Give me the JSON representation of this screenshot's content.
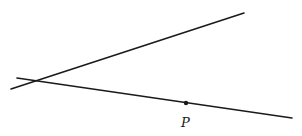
{
  "diagram": {
    "type": "geometry",
    "colors": {
      "stroke": "#1a1a1a",
      "background": "#ffffff"
    },
    "lines": [
      {
        "name": "upper-line",
        "x1": 11,
        "y1": 89,
        "x2": 244,
        "y2": 13
      },
      {
        "name": "lower-line",
        "x1": 17,
        "y1": 78,
        "x2": 292,
        "y2": 118
      }
    ],
    "points": [
      {
        "name": "P",
        "x": 186,
        "y": 103,
        "label": "P",
        "label_x": 181,
        "label_y": 127
      }
    ]
  }
}
